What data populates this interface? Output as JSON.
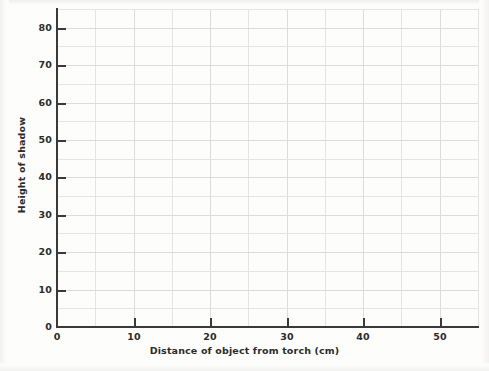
{
  "chart_data": {
    "type": "line",
    "title": "",
    "subtitle": "",
    "xlabel": "Distance of object from torch (cm)",
    "ylabel": "Height of shadow",
    "xlim": [
      0,
      55
    ],
    "ylim": [
      0,
      85
    ],
    "x_tick_labels": [
      "0",
      "10",
      "20",
      "30",
      "40",
      "50"
    ],
    "x_tick_values": [
      0,
      10,
      20,
      30,
      40,
      50
    ],
    "y_tick_labels": [
      "0",
      "10",
      "20",
      "30",
      "40",
      "50",
      "60",
      "70",
      "80"
    ],
    "y_tick_values": [
      0,
      10,
      20,
      30,
      40,
      50,
      60,
      70,
      80
    ],
    "x_gridline_values": [
      0,
      5,
      10,
      15,
      20,
      25,
      30,
      35,
      40,
      45,
      50,
      55
    ],
    "y_gridline_values": [
      0,
      5,
      10,
      15,
      20,
      25,
      30,
      35,
      40,
      45,
      50,
      55,
      60,
      65,
      70,
      75,
      80,
      85
    ],
    "grid": true,
    "legend": null,
    "legend_position": "none",
    "series": [],
    "values": [],
    "annotations": [],
    "colors": {
      "background": "#fdfdfc",
      "axis": "#3a3a3a",
      "gridline": "#e4e4e4",
      "text": "#2b2b2b"
    }
  }
}
